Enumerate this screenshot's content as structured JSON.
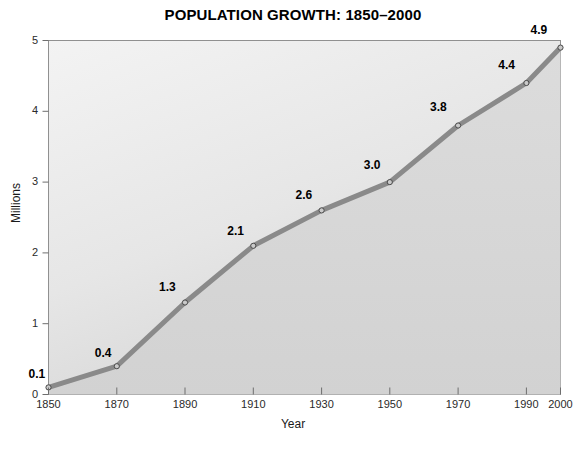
{
  "chart_data": {
    "type": "line",
    "title": "POPULATION GROWTH:  1850–2000",
    "xlabel": "Year",
    "ylabel": "Millions",
    "x": [
      1850,
      1870,
      1890,
      1910,
      1930,
      1950,
      1970,
      1990,
      2000
    ],
    "values": [
      0.1,
      0.4,
      1.3,
      2.1,
      2.6,
      3.0,
      3.8,
      4.4,
      4.9
    ],
    "point_labels": [
      "0.1",
      "0.4",
      "1.3",
      "2.1",
      "2.6",
      "3.0",
      "3.8",
      "4.4",
      "4.9"
    ],
    "xtick_labels": [
      "1850",
      "1870",
      "1890",
      "1910",
      "1930",
      "1950",
      "1970",
      "1990",
      "2000"
    ],
    "ytick_labels": [
      "0",
      "1",
      "2",
      "3",
      "4",
      "5"
    ],
    "yticks": [
      0,
      1,
      2,
      3,
      4,
      5
    ],
    "xlim": [
      1850,
      2000
    ],
    "ylim": [
      0,
      5
    ],
    "grid": false,
    "legend": null,
    "colors": {
      "line": "#8a8a8a",
      "marker_fill": "#c9c9c9",
      "marker_edge": "#4a4a4a",
      "plot_bg_top": "#f2f2f2",
      "plot_bg_bottom": "#d6d6d6",
      "area_fill": "#d8d8d8",
      "frame": "#8c8c8c",
      "text": "#000000",
      "canvas_bg": "#ffffff"
    }
  }
}
